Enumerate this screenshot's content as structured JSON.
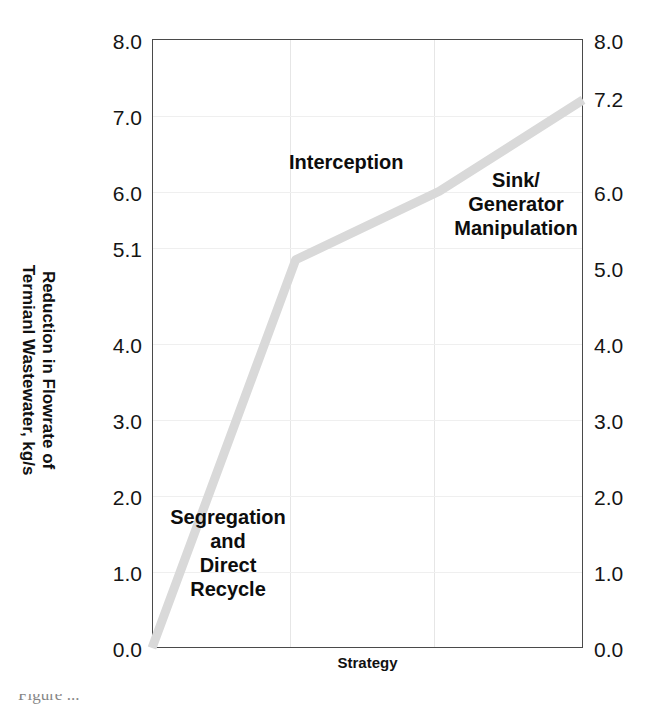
{
  "figure": {
    "ylabel": "Reduction in Flowrate of\nTermianl Wastewater, kg/s",
    "xlabel": "Strategy",
    "caption_partial": "Figure ..."
  },
  "axes": {
    "left_ticks": [
      "8.0",
      "7.0",
      "6.0",
      "5.1",
      "4.0",
      "3.0",
      "2.0",
      "1.0",
      "0.0"
    ],
    "right_ticks": [
      "8.0",
      "7.2",
      "6.0",
      "5.0",
      "4.0",
      "3.0",
      "2.0",
      "1.0",
      "0.0"
    ]
  },
  "annotations": {
    "segregation": "Segregation\nand\nDirect\nRecycle",
    "interception": "Interception",
    "sink": "Sink/\nGenerator\nManipulation"
  },
  "chart_data": {
    "type": "line",
    "title": "",
    "xlabel": "Strategy",
    "ylabel": "Reduction in Flowrate of Termianl Wastewater, kg/s",
    "ylim": [
      0.0,
      8.0
    ],
    "yticks_left": [
      8.0,
      7.0,
      6.0,
      5.1,
      4.0,
      3.0,
      2.0,
      1.0,
      0.0
    ],
    "yticks_right": [
      8.0,
      7.2,
      6.0,
      5.0,
      4.0,
      3.0,
      2.0,
      1.0,
      0.0
    ],
    "grid": true,
    "legend": "none",
    "categories": [
      "Start",
      "Segregation and Direct Recycle",
      "Interception",
      "Sink/Generator Manipulation"
    ],
    "series": [
      {
        "name": "Cumulative reduction in terminal wastewater flowrate",
        "color": "#d9d9d9",
        "values": [
          0.0,
          5.1,
          6.0,
          7.2
        ]
      }
    ],
    "annotations": [
      {
        "label": "Segregation and Direct Recycle",
        "segment": 1,
        "value": 5.1
      },
      {
        "label": "Interception",
        "segment": 2,
        "value": 6.0
      },
      {
        "label": "Sink/Generator Manipulation",
        "segment": 3,
        "value": 7.2
      }
    ]
  }
}
